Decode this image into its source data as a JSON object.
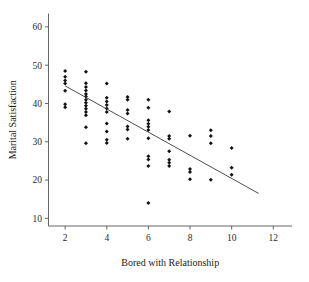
{
  "chart_data": {
    "type": "scatter",
    "title": "",
    "xlabel": "Bored with Relationship",
    "ylabel": "Marital Satisfaction",
    "xlim": [
      1.2,
      12.9
    ],
    "ylim": [
      8.0,
      63.5
    ],
    "xticks": [
      2,
      4,
      6,
      8,
      10,
      12
    ],
    "xticklabels": [
      "2",
      "4",
      "6",
      "8",
      "10",
      "12"
    ],
    "yticks": [
      10,
      20,
      30,
      40,
      50,
      60
    ],
    "yticklabels": [
      "10",
      "20",
      "30",
      "40",
      "50",
      "60"
    ],
    "grid": false,
    "legend": null,
    "marker": "diamond",
    "marker_color": "#121212",
    "points": [
      {
        "x": 2,
        "y": 48.5
      },
      {
        "x": 2,
        "y": 47.0
      },
      {
        "x": 2,
        "y": 46.0
      },
      {
        "x": 2,
        "y": 45.2
      },
      {
        "x": 2,
        "y": 43.3
      },
      {
        "x": 2,
        "y": 39.8
      },
      {
        "x": 2,
        "y": 39.0
      },
      {
        "x": 3,
        "y": 48.3
      },
      {
        "x": 3,
        "y": 45.3
      },
      {
        "x": 3,
        "y": 44.3
      },
      {
        "x": 3,
        "y": 43.4
      },
      {
        "x": 3,
        "y": 42.5
      },
      {
        "x": 3,
        "y": 41.8
      },
      {
        "x": 3,
        "y": 41.0
      },
      {
        "x": 3,
        "y": 40.2
      },
      {
        "x": 3,
        "y": 39.4
      },
      {
        "x": 3,
        "y": 38.6
      },
      {
        "x": 3,
        "y": 37.8
      },
      {
        "x": 3,
        "y": 36.9
      },
      {
        "x": 3,
        "y": 33.8
      },
      {
        "x": 3,
        "y": 29.6
      },
      {
        "x": 4,
        "y": 45.2
      },
      {
        "x": 4,
        "y": 41.5
      },
      {
        "x": 4,
        "y": 40.5
      },
      {
        "x": 4,
        "y": 39.6
      },
      {
        "x": 4,
        "y": 38.7
      },
      {
        "x": 4,
        "y": 37.8
      },
      {
        "x": 4,
        "y": 34.8
      },
      {
        "x": 4,
        "y": 32.7
      },
      {
        "x": 4,
        "y": 30.5
      },
      {
        "x": 4,
        "y": 29.7
      },
      {
        "x": 5,
        "y": 41.7
      },
      {
        "x": 5,
        "y": 41.0
      },
      {
        "x": 5,
        "y": 38.3
      },
      {
        "x": 5,
        "y": 37.4
      },
      {
        "x": 5,
        "y": 34.0
      },
      {
        "x": 5,
        "y": 33.2
      },
      {
        "x": 5,
        "y": 30.8
      },
      {
        "x": 6,
        "y": 41.0
      },
      {
        "x": 6,
        "y": 38.9
      },
      {
        "x": 6,
        "y": 35.6
      },
      {
        "x": 6,
        "y": 34.7
      },
      {
        "x": 6,
        "y": 33.9
      },
      {
        "x": 6,
        "y": 33.1
      },
      {
        "x": 6,
        "y": 30.9
      },
      {
        "x": 6,
        "y": 26.2
      },
      {
        "x": 6,
        "y": 25.4
      },
      {
        "x": 6,
        "y": 23.7
      },
      {
        "x": 6,
        "y": 14.0
      },
      {
        "x": 7,
        "y": 37.9
      },
      {
        "x": 7,
        "y": 31.5
      },
      {
        "x": 7,
        "y": 30.8
      },
      {
        "x": 7,
        "y": 27.5
      },
      {
        "x": 7,
        "y": 25.3
      },
      {
        "x": 7,
        "y": 24.5
      },
      {
        "x": 7,
        "y": 23.7
      },
      {
        "x": 8,
        "y": 31.6
      },
      {
        "x": 8,
        "y": 22.9
      },
      {
        "x": 8,
        "y": 22.1
      },
      {
        "x": 8,
        "y": 20.2
      },
      {
        "x": 9,
        "y": 33.0
      },
      {
        "x": 9,
        "y": 31.5
      },
      {
        "x": 9,
        "y": 29.6
      },
      {
        "x": 9,
        "y": 20.1
      },
      {
        "x": 10,
        "y": 28.4
      },
      {
        "x": 10,
        "y": 23.2
      },
      {
        "x": 10,
        "y": 21.4
      }
    ],
    "fit_line": {
      "label": "regression-line",
      "x0": 2.0,
      "y0": 44.6,
      "x1": 11.3,
      "y1": 16.5,
      "color": "#3a3a3a"
    }
  }
}
